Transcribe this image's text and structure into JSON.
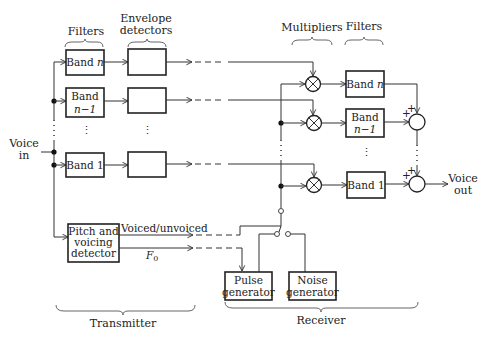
{
  "diagram": {
    "headers": {
      "tx_filters": "Filters",
      "envelope_line1": "Envelope",
      "envelope_line2": "detectors",
      "multipliers": "Multipliers",
      "rx_filters": "Filters"
    },
    "input": {
      "line1": "Voice",
      "line2": "in"
    },
    "output": {
      "line1": "Voice",
      "line2": "out"
    },
    "tx_bands": [
      {
        "line1": "Band ",
        "line1_italic": "n",
        "line2": ""
      },
      {
        "line1": "Band",
        "line2": "n−1"
      },
      {
        "line1": "Band 1",
        "line2": ""
      }
    ],
    "rx_bands": [
      {
        "line1": "Band ",
        "line1_italic": "n",
        "line2": ""
      },
      {
        "line1": "Band",
        "line2": "n−1"
      },
      {
        "line1": "Band 1",
        "line2": ""
      }
    ],
    "pitch_detector": {
      "line1": "Pitch and",
      "line2": "voicing",
      "line3": "detector"
    },
    "signals": {
      "voiced": "Voiced/unvoiced",
      "f0": "F",
      "f0_sub": "0"
    },
    "pulse_generator": {
      "line1": "Pulse",
      "line2": "generator"
    },
    "noise_generator": {
      "line1": "Noise",
      "line2": "generator"
    },
    "adder_signs": "+",
    "ellipsis": "⋮",
    "sections": {
      "transmitter": "Transmitter",
      "receiver": "Receiver"
    }
  }
}
